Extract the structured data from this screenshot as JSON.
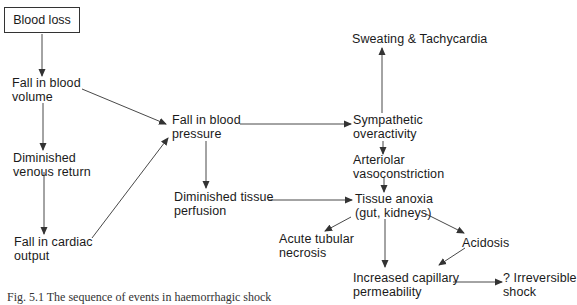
{
  "diagram": {
    "type": "flowchart",
    "nodes": {
      "blood_loss": {
        "label": "Blood loss"
      },
      "fall_blood_volume": {
        "line1": "Fall in blood",
        "line2": "volume"
      },
      "diminished_venous_return": {
        "line1": "Diminished",
        "line2": "venous return"
      },
      "fall_cardiac_output": {
        "line1": "Fall in cardiac",
        "line2": "output"
      },
      "fall_blood_pressure": {
        "line1": "Fall in blood",
        "line2": "pressure"
      },
      "diminished_tissue_perfusion": {
        "line1": "Diminished tissue",
        "line2": "perfusion"
      },
      "sweating_tachycardia": {
        "line1": "Sweating & Tachycardia"
      },
      "sympathetic_overactivity": {
        "line1": "Sympathetic",
        "line2": "overactivity"
      },
      "arteriolar_vasoconstriction": {
        "line1": "Arteriolar",
        "line2": "vasoconstriction"
      },
      "tissue_anoxia": {
        "line1": "Tissue anoxia",
        "line2": "(gut, kidneys)"
      },
      "acute_tubular_necrosis": {
        "line1": "Acute tubular",
        "line2": "necrosis"
      },
      "acidosis": {
        "line1": "Acidosis"
      },
      "increased_capillary_permeability": {
        "line1": "Increased capillary",
        "line2": "permeability"
      },
      "irreversible_shock": {
        "line1": "? Irreversible",
        "line2": "shock"
      }
    },
    "edges": [
      [
        "Blood loss",
        "Fall in blood volume"
      ],
      [
        "Fall in blood volume",
        "Diminished venous return"
      ],
      [
        "Diminished venous return",
        "Fall in cardiac output"
      ],
      [
        "Fall in blood volume",
        "Fall in blood pressure"
      ],
      [
        "Fall in cardiac output",
        "Fall in blood pressure"
      ],
      [
        "Fall in blood pressure",
        "Sympathetic overactivity"
      ],
      [
        "Fall in blood pressure",
        "Diminished tissue perfusion"
      ],
      [
        "Sympathetic overactivity",
        "Sweating & Tachycardia"
      ],
      [
        "Sympathetic overactivity",
        "Arteriolar vasoconstriction"
      ],
      [
        "Arteriolar vasoconstriction",
        "Tissue anoxia (gut, kidneys)"
      ],
      [
        "Diminished tissue perfusion",
        "Tissue anoxia (gut, kidneys)"
      ],
      [
        "Tissue anoxia (gut, kidneys)",
        "Acute tubular necrosis"
      ],
      [
        "Tissue anoxia (gut, kidneys)",
        "Increased capillary permeability"
      ],
      [
        "Tissue anoxia (gut, kidneys)",
        "Acidosis"
      ],
      [
        "Acidosis",
        "Increased capillary permeability"
      ],
      [
        "Increased capillary permeability",
        "? Irreversible shock"
      ]
    ],
    "caption": "Fig. 5.1 The sequence of events in haemorrhagic shock"
  },
  "colors": {
    "line": "#333333",
    "text": "#1a1a1a",
    "background": "#ffffff"
  }
}
